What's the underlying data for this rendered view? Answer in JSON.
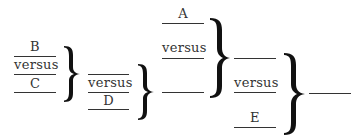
{
  "diagram": {
    "type": "bracket-tournament",
    "groups": [
      {
        "id": "group-1",
        "entries": [
          "B",
          "versus",
          "C"
        ]
      },
      {
        "id": "group-2",
        "entries": [
          "",
          "versus",
          "D"
        ]
      },
      {
        "id": "group-3",
        "entries": [
          "A",
          "versus",
          ""
        ]
      },
      {
        "id": "group-4",
        "entries": [
          "",
          "versus",
          "E"
        ]
      }
    ],
    "labels": {
      "b": "B",
      "versus_1": "versus",
      "c": "C",
      "versus_2": "versus",
      "d": "D",
      "a": "A",
      "versus_3": "versus",
      "versus_4": "versus",
      "e": "E"
    },
    "braces": 4,
    "result_line": ""
  }
}
